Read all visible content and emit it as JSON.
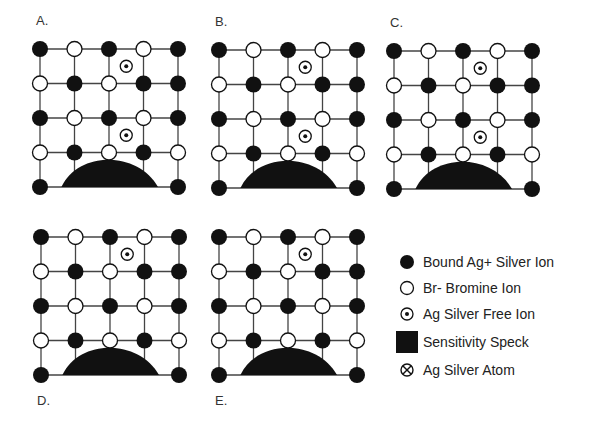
{
  "panels": [
    {
      "label": "A.",
      "label_pos": "top",
      "origin": [
        40,
        49
      ],
      "free_ions": [
        [
          2.5,
          0.5
        ],
        [
          2.5,
          2.5
        ]
      ]
    },
    {
      "label": "B.",
      "label_pos": "top",
      "origin": [
        219,
        50
      ],
      "free_ions": [
        [
          2.5,
          0.5
        ],
        [
          2.5,
          2.5
        ]
      ]
    },
    {
      "label": "C.",
      "label_pos": "top",
      "origin": [
        394,
        51
      ],
      "free_ions": [
        [
          2.5,
          0.5
        ],
        [
          2.5,
          2.5
        ]
      ]
    },
    {
      "label": "D.",
      "label_pos": "bottom",
      "origin": [
        41,
        237
      ],
      "free_ions": [
        [
          2.5,
          0.5
        ]
      ]
    },
    {
      "label": "E.",
      "label_pos": "bottom",
      "origin": [
        219,
        237
      ],
      "free_ions": [
        [
          2.5,
          0.5
        ]
      ]
    }
  ],
  "lattice": {
    "spacing": 34.5,
    "rows": [
      [
        "B",
        "W",
        "B",
        "W",
        "B"
      ],
      [
        "W",
        "B",
        "W",
        "B",
        "B"
      ],
      [
        "B",
        "W",
        "B",
        "W",
        "B"
      ],
      [
        "W",
        "B",
        "W",
        "B",
        "W"
      ],
      [
        "B",
        "-",
        "-",
        "-",
        "B"
      ]
    ]
  },
  "legend": {
    "items": [
      {
        "icon": "filled-circle-icon",
        "label": "Bound Ag+ Silver Ion"
      },
      {
        "icon": "open-circle-icon",
        "label": "Br- Bromine Ion"
      },
      {
        "icon": "dotted-circle-icon",
        "label": "Ag Silver Free Ion"
      },
      {
        "icon": "black-square-icon",
        "label": "Sensitivity Speck"
      },
      {
        "icon": "crossed-circle-icon",
        "label": "Ag Silver Atom"
      }
    ]
  },
  "colors": {
    "ink": "#111111",
    "line": "#444444",
    "background": "#ffffff"
  }
}
